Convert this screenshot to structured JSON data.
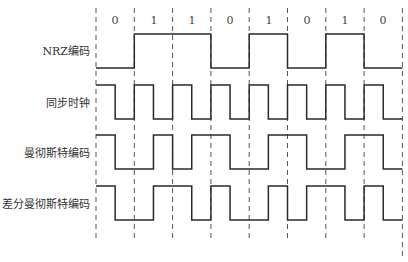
{
  "diagram": {
    "title": "",
    "bits": [
      "0",
      "1",
      "1",
      "0",
      "1",
      "0",
      "1",
      "0"
    ],
    "rows": [
      {
        "id": "nrz",
        "label": "NRZ编码"
      },
      {
        "id": "clock",
        "label": "同步时钟"
      },
      {
        "id": "manchester",
        "label": "曼彻斯特编码"
      },
      {
        "id": "diff_manchester",
        "label": "差分曼彻斯特编码"
      }
    ],
    "colors": {
      "line": "#2a2a2a",
      "dash": "#555555",
      "text": "#333333"
    }
  }
}
